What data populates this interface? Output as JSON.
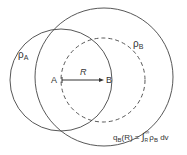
{
  "diagram": {
    "labels": {
      "rho_a": "ρ",
      "rho_a_sub": "A",
      "rho_b": "ρ",
      "rho_b_sub": "B",
      "point_a": "A",
      "point_b": "B",
      "distance": "R"
    },
    "formula": {
      "lhs": "q",
      "lhs_sub": "B",
      "lhs_arg": "(R) = ",
      "integral": "∫",
      "lower": "R",
      "upper": "∞",
      "integrand": "ρ",
      "integrand_sub": "B",
      "differential": " dv"
    },
    "colors": {
      "stroke": "#444444",
      "text": "#333333"
    }
  }
}
